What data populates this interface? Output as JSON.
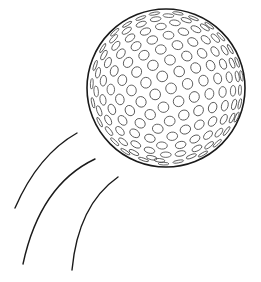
{
  "illustration": {
    "subject": "golf-ball-in-motion",
    "background": "#ffffff",
    "stroke": "#1a1a1a",
    "dimple_stroke": "#3a3a3a",
    "ball": {
      "cx": 166,
      "cy": 88,
      "r": 79
    },
    "motion_lines": [
      {
        "d": "M77,133 Q38,155 15,208"
      },
      {
        "d": "M95,159 Q40,185 23,264"
      },
      {
        "d": "M118,177 Q78,205 72,270"
      }
    ]
  }
}
